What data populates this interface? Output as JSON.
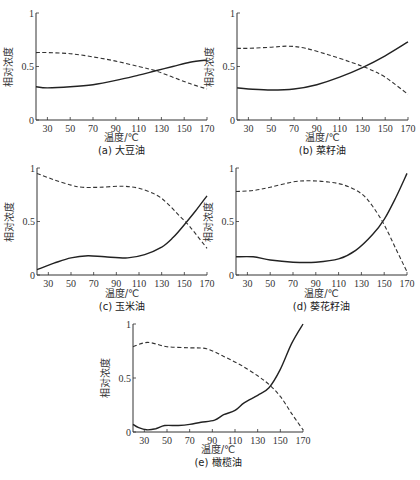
{
  "chart_data": [
    {
      "type": "line",
      "caption": "(a) 大豆油",
      "xlabel": "温度/℃",
      "ylabel": "相对浓度",
      "xlim": [
        20,
        170
      ],
      "ylim": [
        0,
        1
      ],
      "xticks": [
        30,
        50,
        70,
        90,
        110,
        130,
        150,
        170
      ],
      "yticks": [
        0,
        0.5,
        1
      ],
      "ytick_labels": [
        "0",
        "0.5",
        "1"
      ],
      "grid": false,
      "series": [
        {
          "name": "solid",
          "style": "solid",
          "x": [
            20,
            30,
            50,
            70,
            90,
            110,
            125,
            140,
            155,
            170
          ],
          "y": [
            0.31,
            0.3,
            0.31,
            0.33,
            0.37,
            0.42,
            0.46,
            0.5,
            0.54,
            0.56
          ]
        },
        {
          "name": "dashed",
          "style": "dashed",
          "x": [
            20,
            30,
            50,
            70,
            90,
            110,
            125,
            140,
            155,
            170
          ],
          "y": [
            0.63,
            0.63,
            0.62,
            0.59,
            0.55,
            0.5,
            0.46,
            0.4,
            0.34,
            0.29
          ]
        }
      ]
    },
    {
      "type": "line",
      "caption": "(b) 菜籽油",
      "xlabel": "温度/℃",
      "ylabel": "相对浓度",
      "xlim": [
        20,
        170
      ],
      "ylim": [
        0,
        1
      ],
      "xticks": [
        30,
        50,
        70,
        90,
        110,
        130,
        150,
        170
      ],
      "yticks": [
        0,
        0.5,
        1
      ],
      "ytick_labels": [
        "0",
        "0.5",
        "1"
      ],
      "grid": false,
      "series": [
        {
          "name": "solid",
          "style": "solid",
          "x": [
            20,
            30,
            50,
            70,
            90,
            110,
            130,
            150,
            170
          ],
          "y": [
            0.3,
            0.29,
            0.28,
            0.29,
            0.33,
            0.4,
            0.49,
            0.6,
            0.73
          ]
        },
        {
          "name": "dashed",
          "style": "dashed",
          "x": [
            20,
            30,
            50,
            65,
            80,
            100,
            120,
            135,
            150,
            170
          ],
          "y": [
            0.67,
            0.67,
            0.68,
            0.69,
            0.67,
            0.61,
            0.54,
            0.48,
            0.4,
            0.24
          ]
        }
      ]
    },
    {
      "type": "line",
      "caption": "(c) 玉米油",
      "xlabel": "温度/℃",
      "ylabel": "相对浓度",
      "xlim": [
        20,
        170
      ],
      "ylim": [
        0,
        1
      ],
      "xticks": [
        30,
        50,
        70,
        90,
        110,
        130,
        150,
        170
      ],
      "yticks": [
        0,
        0.5,
        1
      ],
      "ytick_labels": [
        "0",
        "0.5",
        "1"
      ],
      "grid": false,
      "series": [
        {
          "name": "solid",
          "style": "solid",
          "x": [
            20,
            35,
            50,
            65,
            80,
            100,
            115,
            130,
            140,
            150,
            160,
            170
          ],
          "y": [
            0.05,
            0.11,
            0.16,
            0.18,
            0.17,
            0.16,
            0.19,
            0.26,
            0.35,
            0.47,
            0.6,
            0.74
          ]
        },
        {
          "name": "dashed",
          "style": "dashed",
          "x": [
            20,
            35,
            50,
            60,
            75,
            95,
            110,
            125,
            135,
            145,
            155,
            170
          ],
          "y": [
            0.95,
            0.89,
            0.84,
            0.82,
            0.82,
            0.83,
            0.81,
            0.75,
            0.67,
            0.56,
            0.45,
            0.25
          ]
        }
      ]
    },
    {
      "type": "line",
      "caption": "(d) 葵花籽油",
      "xlabel": "温度/℃",
      "ylabel": "相对浓度",
      "xlim": [
        20,
        170
      ],
      "ylim": [
        0,
        1
      ],
      "xticks": [
        30,
        50,
        70,
        90,
        110,
        130,
        150,
        170
      ],
      "yticks": [
        0,
        0.5,
        1
      ],
      "ytick_labels": [
        "0",
        "0.5",
        "1"
      ],
      "grid": false,
      "series": [
        {
          "name": "solid",
          "style": "solid",
          "x": [
            20,
            35,
            50,
            70,
            90,
            110,
            125,
            140,
            150,
            160,
            170
          ],
          "y": [
            0.17,
            0.17,
            0.14,
            0.12,
            0.12,
            0.15,
            0.23,
            0.38,
            0.52,
            0.72,
            0.95
          ]
        },
        {
          "name": "dashed",
          "style": "dashed",
          "x": [
            20,
            35,
            50,
            70,
            85,
            100,
            115,
            130,
            140,
            150,
            160,
            170
          ],
          "y": [
            0.78,
            0.79,
            0.82,
            0.87,
            0.88,
            0.87,
            0.84,
            0.76,
            0.64,
            0.47,
            0.25,
            0.03
          ]
        }
      ]
    },
    {
      "type": "line",
      "caption": "(e) 橄榄油",
      "xlabel": "温度/℃",
      "ylabel": "相对浓度",
      "xlim": [
        20,
        170
      ],
      "ylim": [
        0,
        1
      ],
      "xticks": [
        30,
        50,
        70,
        90,
        110,
        130,
        150,
        170
      ],
      "yticks": [
        0,
        0.5,
        1
      ],
      "ytick_labels": [
        "0",
        "0.5",
        "1"
      ],
      "grid": false,
      "series": [
        {
          "name": "solid",
          "style": "solid",
          "x": [
            20,
            25,
            32,
            40,
            48,
            60,
            70,
            80,
            92,
            100,
            110,
            118,
            130,
            140,
            150,
            160,
            170
          ],
          "y": [
            0.07,
            0.04,
            0.02,
            0.03,
            0.06,
            0.06,
            0.07,
            0.09,
            0.11,
            0.16,
            0.2,
            0.27,
            0.34,
            0.41,
            0.58,
            0.82,
            1.0
          ]
        },
        {
          "name": "dashed",
          "style": "dashed",
          "x": [
            20,
            33,
            50,
            70,
            85,
            100,
            115,
            130,
            140,
            150,
            160,
            170
          ],
          "y": [
            0.79,
            0.83,
            0.79,
            0.78,
            0.77,
            0.7,
            0.62,
            0.52,
            0.44,
            0.33,
            0.17,
            0.02
          ]
        }
      ]
    }
  ]
}
